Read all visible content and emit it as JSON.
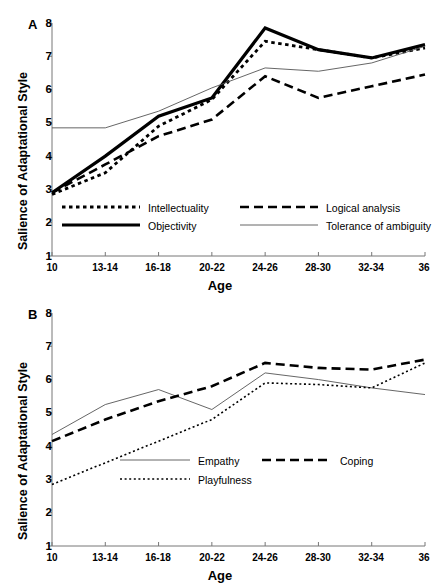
{
  "figure": {
    "axis_label_x": "Age",
    "axis_label_y": "Salience of Adaptational Style",
    "panel_a_letter": "A",
    "panel_b_letter": "B",
    "y_ticks": [
      "1",
      "2",
      "3",
      "4",
      "5",
      "6",
      "7",
      "8"
    ],
    "x_ticks": [
      "10",
      "13-14",
      "16-18",
      "20-22",
      "24-26",
      "28-30",
      "32-34",
      "36"
    ],
    "line_color": "#000000",
    "thin_line_color": "#555555"
  },
  "legend_a": {
    "items": [
      {
        "label": "Intellectuality",
        "style": "dotted-medium"
      },
      {
        "label": "Logical analysis",
        "style": "dashed-long"
      },
      {
        "label": "Objectivity",
        "style": "solid-thick"
      },
      {
        "label": "Tolerance of ambiguity",
        "style": "solid-thin"
      }
    ]
  },
  "legend_b": {
    "items": [
      {
        "label": "Empathy",
        "style": "solid-thin"
      },
      {
        "label": "Coping",
        "style": "dashed-long"
      },
      {
        "label": "Playfulness",
        "style": "dotted-fine"
      }
    ]
  },
  "chart_data": [
    {
      "type": "line",
      "panel": "A",
      "title": "",
      "xlabel": "Age",
      "ylabel": "Salience of Adaptational Style",
      "categories": [
        "10",
        "13-14",
        "16-18",
        "20-22",
        "24-26",
        "28-30",
        "32-34",
        "36"
      ],
      "ylim": [
        1,
        8
      ],
      "yticks": [
        1,
        2,
        3,
        4,
        5,
        6,
        7,
        8
      ],
      "grid": false,
      "legend_position": "inside-bottom",
      "series": [
        {
          "name": "Intellectuality",
          "style": "dotted-medium",
          "values": [
            2.85,
            3.5,
            4.9,
            5.7,
            7.45,
            7.2,
            6.95,
            7.25
          ]
        },
        {
          "name": "Logical analysis",
          "style": "dashed-long",
          "values": [
            2.9,
            3.75,
            4.6,
            5.1,
            6.4,
            5.75,
            6.1,
            6.45
          ]
        },
        {
          "name": "Objectivity",
          "style": "solid-thick",
          "values": [
            2.9,
            4.0,
            5.2,
            5.75,
            7.85,
            7.2,
            6.95,
            7.35
          ]
        },
        {
          "name": "Tolerance of ambiguity",
          "style": "solid-thin",
          "values": [
            4.85,
            4.85,
            5.35,
            6.05,
            6.65,
            6.55,
            6.8,
            7.3
          ]
        }
      ]
    },
    {
      "type": "line",
      "panel": "B",
      "title": "",
      "xlabel": "Age",
      "ylabel": "Salience of Adaptational Style",
      "categories": [
        "10",
        "13-14",
        "16-18",
        "20-22",
        "24-26",
        "28-30",
        "32-34",
        "36"
      ],
      "ylim": [
        1,
        8
      ],
      "yticks": [
        1,
        2,
        3,
        4,
        5,
        6,
        7,
        8
      ],
      "grid": false,
      "legend_position": "inside-bottom",
      "series": [
        {
          "name": "Empathy",
          "style": "solid-thin",
          "values": [
            4.35,
            5.25,
            5.7,
            5.1,
            6.2,
            6.0,
            5.75,
            5.55
          ]
        },
        {
          "name": "Coping",
          "style": "dashed-long",
          "values": [
            4.15,
            4.8,
            5.35,
            5.8,
            6.5,
            6.35,
            6.3,
            6.6
          ]
        },
        {
          "name": "Playfulness",
          "style": "dotted-fine",
          "values": [
            2.85,
            3.5,
            4.15,
            4.8,
            5.9,
            5.85,
            5.75,
            6.5
          ]
        }
      ]
    }
  ]
}
